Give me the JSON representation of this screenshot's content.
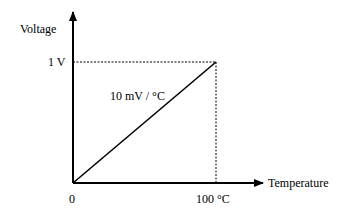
{
  "diagram": {
    "type": "linear-transfer-function",
    "y_axis": {
      "label": "Voltage"
    },
    "x_axis": {
      "label": "Temperature"
    },
    "ticks": {
      "y_max": "1 V",
      "x_origin": "0",
      "x_max": "100 °C"
    },
    "slope_label": "10 mV / °C",
    "line": {
      "from": [
        0,
        0
      ],
      "to": [
        100,
        1
      ],
      "x_unit": "°C",
      "y_unit": "V"
    },
    "colors": {
      "stroke": "#000000",
      "background": "#ffffff"
    }
  }
}
